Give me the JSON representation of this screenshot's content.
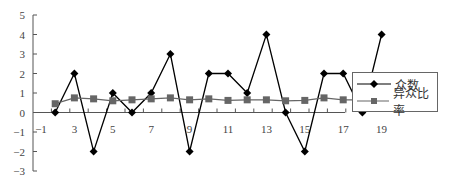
{
  "chart_data": {
    "type": "line",
    "title": "",
    "xlabel": "",
    "ylabel": "",
    "x": [
      2,
      3,
      4,
      5,
      6,
      7,
      8,
      9,
      10,
      11,
      12,
      13,
      14,
      15,
      16,
      17,
      18,
      19
    ],
    "x_tick_labels": [
      "-1",
      "3",
      "5",
      "7",
      "9",
      "11",
      "13",
      "15",
      "17",
      "19"
    ],
    "y_tick_labels": [
      "5",
      "4",
      "3",
      "2",
      "1",
      "0",
      "-1",
      "-2",
      "-3"
    ],
    "ylim": [
      -3,
      5
    ],
    "xlim": [
      1,
      20
    ],
    "grid": false,
    "legend_position": "right",
    "series": [
      {
        "name": "众数",
        "marker": "diamond",
        "color": "#000000",
        "values": [
          0,
          2,
          -2,
          1,
          0,
          1,
          3,
          -2,
          2,
          2,
          1,
          4,
          0,
          -2,
          2,
          2,
          0,
          4
        ]
      },
      {
        "name": "异众比率",
        "marker": "square",
        "color": "#666666",
        "values": [
          0.45,
          0.75,
          0.7,
          0.6,
          0.65,
          0.7,
          0.75,
          0.65,
          0.7,
          0.62,
          0.65,
          0.65,
          0.6,
          0.62,
          0.75,
          0.65,
          0.65,
          0.75
        ]
      }
    ]
  },
  "legend": {
    "items": [
      {
        "label": "众数"
      },
      {
        "label": "异众比率"
      }
    ]
  }
}
